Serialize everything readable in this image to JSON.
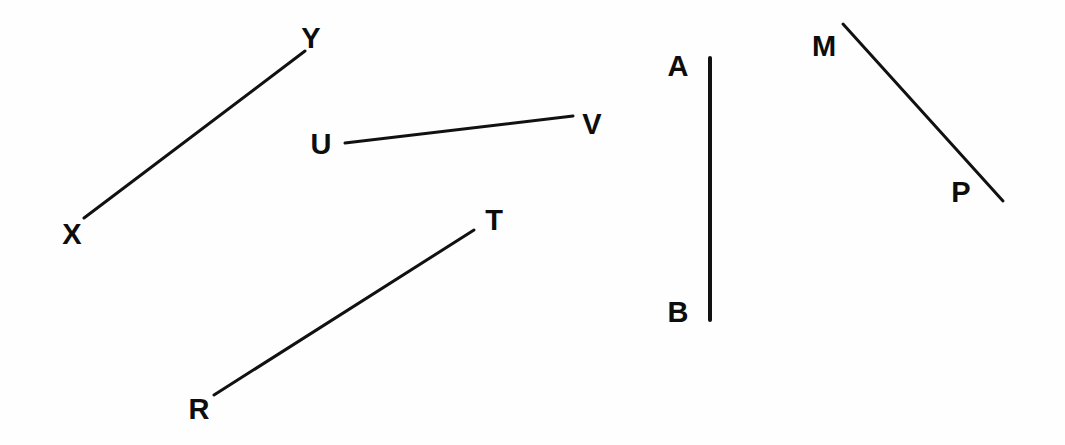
{
  "figure": {
    "background_color": "#fefefe",
    "ink_color": "#111111",
    "width": 1065,
    "height": 445
  },
  "segments": [
    {
      "id": "XY",
      "name": "segment-xy",
      "stroke_width": 3,
      "x1": 84,
      "y1": 218,
      "x2": 305,
      "y2": 51,
      "endpoints": [
        {
          "label": "X",
          "x": 72,
          "y": 234
        },
        {
          "label": "Y",
          "x": 311,
          "y": 38
        }
      ]
    },
    {
      "id": "UV",
      "name": "segment-uv",
      "stroke_width": 3,
      "x1": 345,
      "y1": 143,
      "x2": 573,
      "y2": 116,
      "endpoints": [
        {
          "label": "U",
          "x": 321,
          "y": 144
        },
        {
          "label": "V",
          "x": 592,
          "y": 124
        }
      ]
    },
    {
      "id": "RT",
      "name": "segment-rt",
      "stroke_width": 3,
      "x1": 214,
      "y1": 395,
      "x2": 474,
      "y2": 230,
      "endpoints": [
        {
          "label": "R",
          "x": 199,
          "y": 409
        },
        {
          "label": "T",
          "x": 494,
          "y": 220
        }
      ]
    },
    {
      "id": "AB",
      "name": "segment-ab",
      "stroke_width": 4,
      "x1": 710,
      "y1": 58,
      "x2": 710,
      "y2": 320,
      "endpoints": [
        {
          "label": "A",
          "x": 678,
          "y": 66
        },
        {
          "label": "B",
          "x": 678,
          "y": 312
        }
      ]
    },
    {
      "id": "MP",
      "name": "segment-mp",
      "stroke_width": 3,
      "x1": 843,
      "y1": 24,
      "x2": 1003,
      "y2": 201,
      "endpoints": [
        {
          "label": "M",
          "x": 824,
          "y": 46
        },
        {
          "label": "P",
          "x": 961,
          "y": 192
        }
      ]
    }
  ]
}
